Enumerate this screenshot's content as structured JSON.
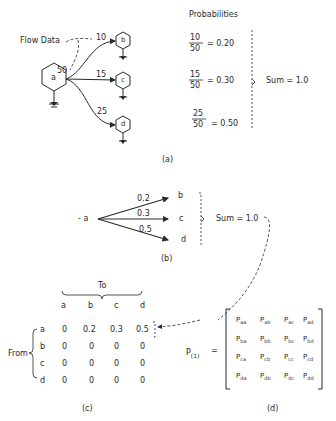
{
  "panel_a": {
    "caption": "(a)",
    "flow_label": "Flow Data",
    "nodes": {
      "a": "a",
      "b": "b",
      "c": "c",
      "d": "d"
    },
    "total_flow": "50",
    "flows": [
      {
        "to": "b",
        "value": "10"
      },
      {
        "to": "c",
        "value": "15"
      },
      {
        "to": "d",
        "value": "25"
      }
    ],
    "probabilities_title": "Probabilities",
    "probabilities": [
      {
        "num": "10",
        "den": "50",
        "result": "= 0.20"
      },
      {
        "num": "15",
        "den": "50",
        "result": "= 0.30"
      },
      {
        "num": "25",
        "den": "50",
        "result": "= 0.50"
      }
    ],
    "sum_label": "Sum = 1.0"
  },
  "panel_b": {
    "caption": "(b)",
    "source": "a",
    "targets": [
      {
        "node": "b",
        "prob": "0.2"
      },
      {
        "node": "c",
        "prob": "0.3"
      },
      {
        "node": "d",
        "prob": "0.5"
      }
    ],
    "sum_label": "Sum = 1.0"
  },
  "panel_c": {
    "caption": "(c)",
    "to_label": "To",
    "from_label": "From",
    "columns": [
      "a",
      "b",
      "c",
      "d"
    ],
    "rows": [
      {
        "label": "a",
        "values": [
          "0",
          "0.2",
          "0.3",
          "0.5"
        ]
      },
      {
        "label": "b",
        "values": [
          "0",
          "0",
          "0",
          "0"
        ]
      },
      {
        "label": "c",
        "values": [
          "0",
          "0",
          "0",
          "0"
        ]
      },
      {
        "label": "d",
        "values": [
          "0",
          "0",
          "0",
          "0"
        ]
      }
    ]
  },
  "panel_d": {
    "caption": "(d)",
    "lhs": "P",
    "lhs_sub": "(1)",
    "equals": "=",
    "matrix": [
      [
        "aa",
        "ab",
        "ac",
        "ad"
      ],
      [
        "ba",
        "bb",
        "bc",
        "bd"
      ],
      [
        "ca",
        "cb",
        "cc",
        "cd"
      ],
      [
        "da",
        "db",
        "dc",
        "dd"
      ]
    ],
    "entry_symbol": "P"
  }
}
